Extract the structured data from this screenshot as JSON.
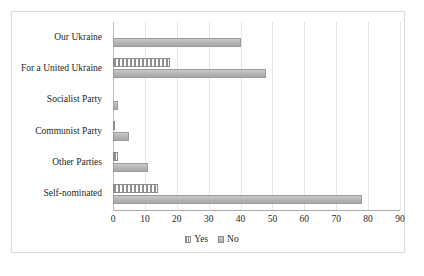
{
  "chart_data": {
    "type": "bar",
    "orientation": "horizontal",
    "title": "",
    "subtitle": "",
    "xlabel": "",
    "ylabel": "",
    "xlim": [
      0,
      90
    ],
    "xticks": [
      "0",
      "10",
      "20",
      "30",
      "40",
      "50",
      "60",
      "70",
      "80",
      "90"
    ],
    "xtick_values": [
      0,
      10,
      20,
      30,
      40,
      50,
      60,
      70,
      80,
      90
    ],
    "grid": "vertical",
    "legend_position": "bottom-center",
    "categories": [
      "Our Ukraine",
      "For a United Ukraine",
      "Socialist Party",
      "Communist Party",
      "Other Parties",
      "Self-nominated"
    ],
    "series": [
      {
        "name": "Yes",
        "pattern": "vertical-stripes",
        "color": "#a6a6a6",
        "values": [
          0,
          18,
          0,
          0.3,
          1.5,
          14
        ]
      },
      {
        "name": "No",
        "pattern": "solid",
        "color": "#b4b4b4",
        "values": [
          40,
          48,
          1.5,
          5,
          11,
          78
        ]
      }
    ]
  },
  "legend": {
    "entries": [
      {
        "label": "Yes",
        "icon": "legend-swatch-striped"
      },
      {
        "label": "No",
        "icon": "legend-swatch-solid"
      }
    ]
  }
}
